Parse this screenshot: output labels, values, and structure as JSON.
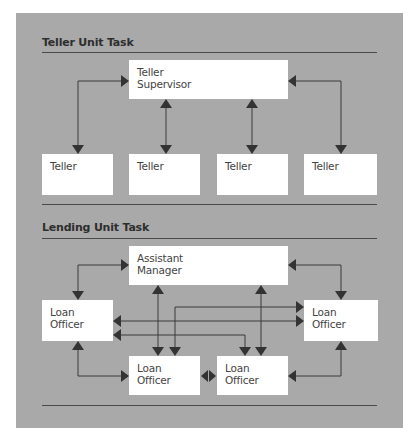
{
  "diagram": {
    "background_color": "#a9a9a9",
    "box_color": "#ffffff",
    "line_color": "#3a3a3a",
    "sections": [
      {
        "title": "Teller Unit Task",
        "nodes": {
          "supervisor": {
            "line1": "Teller",
            "line2": "Supervisor"
          },
          "tellers": [
            {
              "label": "Teller"
            },
            {
              "label": "Teller"
            },
            {
              "label": "Teller"
            },
            {
              "label": "Teller"
            }
          ]
        },
        "connections": [
          "Teller Supervisor <-> Teller 1",
          "Teller Supervisor <-> Teller 2",
          "Teller Supervisor <-> Teller 3",
          "Teller Supervisor <-> Teller 4"
        ]
      },
      {
        "title": "Lending Unit Task",
        "nodes": {
          "manager": {
            "line1": "Assistant",
            "line2": "Manager"
          },
          "loan_officers": [
            {
              "line1": "Loan",
              "line2": "Officer",
              "position": "left"
            },
            {
              "line1": "Loan",
              "line2": "Officer",
              "position": "right"
            },
            {
              "line1": "Loan",
              "line2": "Officer",
              "position": "bottom-left"
            },
            {
              "line1": "Loan",
              "line2": "Officer",
              "position": "bottom-right"
            }
          ]
        },
        "connections": [
          "Assistant Manager <-> Loan Officer (left)",
          "Assistant Manager <-> Loan Officer (right)",
          "Assistant Manager <-> Loan Officer (bottom-left)",
          "Assistant Manager <-> Loan Officer (bottom-right)",
          "Loan Officer (left) <-> Loan Officer (right)",
          "Loan Officer (left) <-> Loan Officer (bottom-left)",
          "Loan Officer (left) <-> Loan Officer (bottom-right)",
          "Loan Officer (right) <-> Loan Officer (bottom-left)",
          "Loan Officer (right) <-> Loan Officer (bottom-right)",
          "Loan Officer (bottom-left) <-> Loan Officer (bottom-right)"
        ]
      }
    ]
  }
}
